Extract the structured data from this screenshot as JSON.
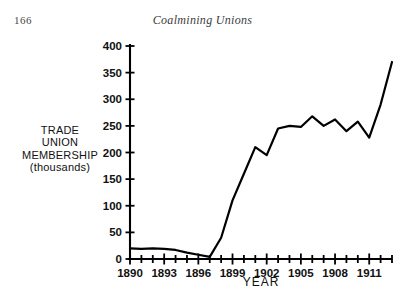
{
  "page": {
    "folio": "166",
    "running_title": "Coalmining Unions"
  },
  "chart_data": {
    "type": "line",
    "title": "",
    "xlabel": "YEAR",
    "ylabel": "TRADE\nUNION\nMEMBERSHIP\n(thousands)",
    "ylabel_lines": [
      "TRADE",
      "UNION",
      "MEMBERSHIP",
      "(thousands)"
    ],
    "xlim": [
      1890,
      1913
    ],
    "ylim": [
      0,
      400
    ],
    "ytick_step": 50,
    "xtick_step": 1,
    "xtick_label_step": 3,
    "grid": false,
    "legend": false,
    "line_color": "#000000",
    "axis_color": "#000000",
    "yticks": [
      0,
      50,
      100,
      150,
      200,
      250,
      300,
      350,
      400
    ],
    "ytick_labels": [
      "0",
      "50",
      "100",
      "150",
      "200",
      "250",
      "300",
      "350",
      "400"
    ],
    "xticks": [
      1890,
      1891,
      1892,
      1893,
      1894,
      1895,
      1896,
      1897,
      1898,
      1899,
      1900,
      1901,
      1902,
      1903,
      1904,
      1905,
      1906,
      1907,
      1908,
      1909,
      1910,
      1911,
      1912,
      1913
    ],
    "xtick_labels": [
      "1890",
      "1893",
      "1896",
      "1899",
      "1902",
      "1905",
      "1908",
      "1911"
    ],
    "xtick_labelled_values": [
      1890,
      1893,
      1896,
      1899,
      1902,
      1905,
      1908,
      1911
    ],
    "x": [
      1890,
      1891,
      1892,
      1893,
      1894,
      1895,
      1896,
      1897,
      1898,
      1899,
      1900,
      1901,
      1902,
      1903,
      1904,
      1905,
      1906,
      1907,
      1908,
      1909,
      1910,
      1911,
      1912,
      1913
    ],
    "values": [
      20,
      19,
      20,
      19,
      17,
      12,
      8,
      4,
      40,
      110,
      160,
      210,
      195,
      245,
      250,
      248,
      268,
      250,
      262,
      240,
      258,
      228,
      290,
      370
    ],
    "series": [
      {
        "name": "Trade union membership",
        "values": [
          20,
          19,
          20,
          19,
          17,
          12,
          8,
          4,
          40,
          110,
          160,
          210,
          195,
          245,
          250,
          248,
          268,
          250,
          262,
          240,
          258,
          228,
          290,
          370
        ]
      }
    ]
  }
}
